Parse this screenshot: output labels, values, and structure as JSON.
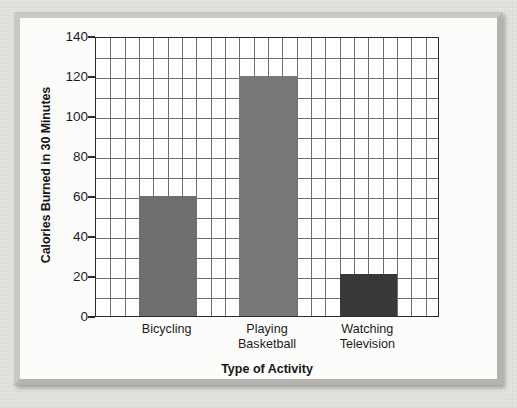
{
  "chart_data": {
    "type": "bar",
    "title": "",
    "xlabel": "Type of Activity",
    "ylabel": "Calories Burned in 30 Minutes",
    "categories": [
      "Bicycling",
      "Playing Basketball",
      "Watching Television"
    ],
    "category_lines": [
      [
        "Bicycling"
      ],
      [
        "Playing",
        "Basketball"
      ],
      [
        "Watching",
        "Television"
      ]
    ],
    "values": [
      60,
      120,
      21
    ],
    "bar_colors": [
      "#6e6e6e",
      "#787878",
      "#383838"
    ],
    "ylim": [
      0,
      140
    ],
    "y_ticks": [
      0,
      20,
      40,
      60,
      80,
      100,
      120,
      140
    ],
    "y_tick_labels": [
      "0",
      "20",
      "40",
      "60",
      "80",
      "100",
      "120",
      "140"
    ],
    "y_minor_step": 10,
    "x_gridline_count": 23,
    "grid": true,
    "legend": "none"
  },
  "figure": {
    "frame_color": "#c9c8c4",
    "plot_background": "#ffffff",
    "grid_color": "#6f6f72",
    "axis_color": "#2b2b2b",
    "page_background": "#e8e7e4"
  }
}
